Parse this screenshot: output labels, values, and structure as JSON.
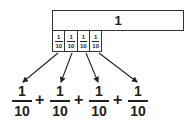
{
  "diagram": {
    "whole": {
      "label": "1"
    },
    "parts": [
      {
        "numerator": "1",
        "denominator": "10"
      },
      {
        "numerator": "1",
        "denominator": "10"
      },
      {
        "numerator": "1",
        "denominator": "10"
      },
      {
        "numerator": "1",
        "denominator": "10"
      }
    ],
    "expression": {
      "terms": [
        {
          "numerator": "1",
          "denominator": "10"
        },
        {
          "numerator": "1",
          "denominator": "10"
        },
        {
          "numerator": "1",
          "denominator": "10"
        },
        {
          "numerator": "1",
          "denominator": "10"
        }
      ],
      "operators": [
        "+",
        "+",
        "+"
      ]
    },
    "colors": {
      "stroke": "#333333",
      "text": "#222222",
      "background": "#ffffff"
    }
  }
}
